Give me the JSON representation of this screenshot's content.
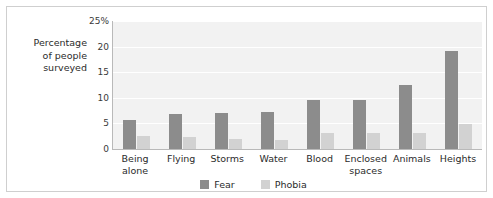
{
  "chart_data": {
    "type": "bar",
    "title": "",
    "subtitle": "",
    "xlabel": "",
    "ylabel": "Percentage\nof people\nsurveyed",
    "categories": [
      "Being\nalone",
      "Flying",
      "Storms",
      "Water",
      "Blood",
      "Enclosed\nspaces",
      "Animals",
      "Heights"
    ],
    "series": [
      {
        "name": "Fear",
        "color": "#8c8c8c",
        "values": [
          5.7,
          6.9,
          7.1,
          7.2,
          9.6,
          9.6,
          12.5,
          19.2
        ]
      },
      {
        "name": "Phobia",
        "color": "#d2d2d2",
        "values": [
          2.6,
          2.4,
          2.0,
          1.8,
          3.1,
          3.1,
          3.1,
          4.9
        ]
      }
    ],
    "ylim": [
      0,
      25
    ],
    "yticks": [
      0,
      5,
      10,
      15,
      20,
      25
    ],
    "ytick_labels": [
      "0",
      "5",
      "10",
      "15",
      "20",
      "25%"
    ],
    "grid": true,
    "grid_axis": "y",
    "legend_position": "bottom-center"
  },
  "legend": {
    "entries": [
      {
        "label": "Fear"
      },
      {
        "label": "Phobia"
      }
    ]
  },
  "colors": {
    "fear": "#8c8c8c",
    "phobia": "#d2d2d2",
    "plot_background": "#f2f2f2",
    "gridline": "#ffffff",
    "axis": "#b9b9b9",
    "border": "#cfcfcf",
    "text": "#2b2b2b"
  }
}
